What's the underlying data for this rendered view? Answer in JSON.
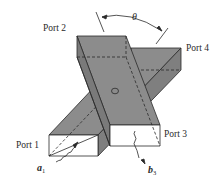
{
  "figure": {
    "type": "waveguide-directional-coupler",
    "labels": {
      "port1": "Port 1",
      "port2": "Port 2",
      "port3": "Port 3",
      "port4": "Port 4",
      "angle": "θ",
      "incident_wave": "a",
      "incident_wave_sub": "1",
      "output_wave": "b",
      "output_wave_sub": "3"
    },
    "colors": {
      "guide_fill": "#8c8c8c",
      "guide_fill_dark": "#7a7a7a",
      "end_face": "#ffffff",
      "stroke": "#2a2a2a",
      "background": "#ffffff"
    }
  }
}
